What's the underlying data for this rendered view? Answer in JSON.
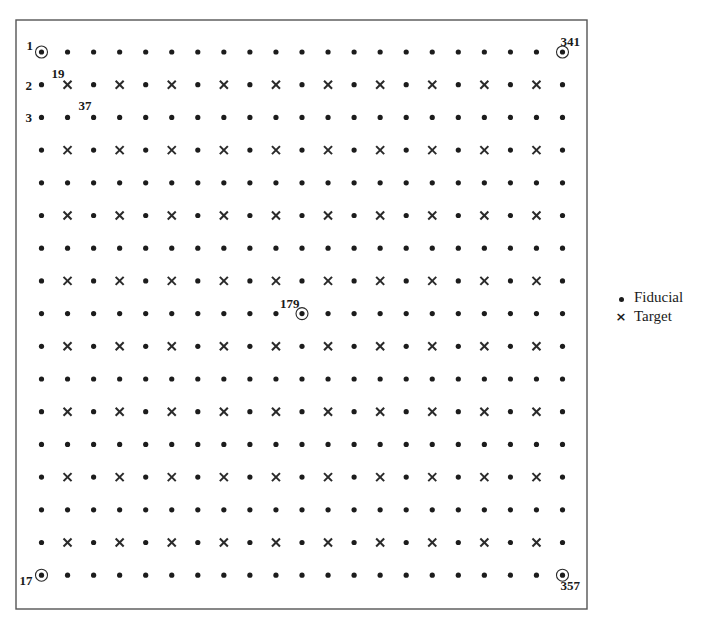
{
  "diagram": {
    "type": "point-grid",
    "frame": {
      "left": 16,
      "top": 20,
      "right": 587,
      "bottom": 609
    },
    "grid": {
      "columns": 21,
      "rows": 17,
      "x_start": 41.5,
      "x_step": 26.05,
      "y_start": 52,
      "y_step": 32.7,
      "numbering": "column-major, top-to-bottom, 17 points per column",
      "target_rule": "even row index and even column index (1-based) are targets"
    },
    "labeled_points": [
      {
        "id": "1",
        "col": 1,
        "row": 1,
        "circled": true,
        "label_dx": -15,
        "label_dy": -2
      },
      {
        "id": "2",
        "col": 1,
        "row": 2,
        "circled": false,
        "label_dx": -16,
        "label_dy": 5
      },
      {
        "id": "3",
        "col": 1,
        "row": 3,
        "circled": false,
        "label_dx": -16,
        "label_dy": 5
      },
      {
        "id": "17",
        "col": 1,
        "row": 17,
        "circled": true,
        "label_dx": -22,
        "label_dy": 10
      },
      {
        "id": "19",
        "col": 2,
        "row": 2,
        "circled": false,
        "label_dx": -16,
        "label_dy": -7
      },
      {
        "id": "37",
        "col": 3,
        "row": 3,
        "circled": false,
        "label_dx": -15,
        "label_dy": -7
      },
      {
        "id": "179",
        "col": 11,
        "row": 9,
        "circled": true,
        "label_dx": -22,
        "label_dy": -6
      },
      {
        "id": "341",
        "col": 21,
        "row": 1,
        "circled": true,
        "label_dx": -2,
        "label_dy": -6
      },
      {
        "id": "357",
        "col": 21,
        "row": 17,
        "circled": true,
        "label_dx": -2,
        "label_dy": 15
      }
    ]
  },
  "legend": {
    "items": [
      {
        "symbol": "dot",
        "label": "Fiducial"
      },
      {
        "symbol": "cross",
        "label": "Target"
      }
    ]
  }
}
